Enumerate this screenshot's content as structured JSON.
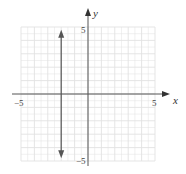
{
  "chart_data": {
    "type": "line",
    "title": "",
    "xlabel": "x",
    "ylabel": "y",
    "xlim": [
      -5,
      5
    ],
    "ylim": [
      -5,
      5
    ],
    "grid": true,
    "x_tick_labels": [
      "-5",
      "5"
    ],
    "y_tick_labels": [
      "5",
      "-5"
    ],
    "series": [
      {
        "name": "x = -2",
        "equation": "x = -2",
        "kind": "vertical-line",
        "x": [
          -2,
          -2
        ],
        "y": [
          -4.8,
          4.8
        ],
        "arrows": "both",
        "color": "#555555"
      }
    ],
    "legend": null
  },
  "labels": {
    "x_axis": "x",
    "y_axis": "y",
    "x_min": "−5",
    "x_max": "5",
    "y_max": "5",
    "y_min": "−5"
  },
  "colors": {
    "grid": "#e2e2e2",
    "axis": "#555555",
    "line": "#555555"
  }
}
